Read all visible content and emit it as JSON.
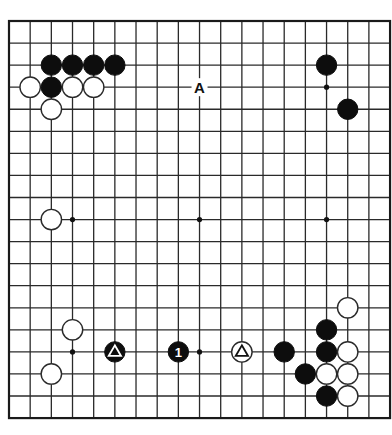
{
  "board": {
    "size": 19,
    "origin_x": 9,
    "origin_y": 21,
    "spacing_x": 21.17,
    "spacing_y": 22.06,
    "stone_radius": 10.2,
    "colors": {
      "black": "#0d0d0d",
      "white": "#ffffff",
      "line": "#2a2a2a"
    }
  },
  "star_points": [
    [
      3,
      15
    ],
    [
      9,
      15
    ],
    [
      15,
      3
    ],
    [
      3,
      9
    ],
    [
      9,
      9
    ],
    [
      15,
      9
    ]
  ],
  "stones": [
    {
      "color": "black",
      "col": 2,
      "row": 2
    },
    {
      "color": "black",
      "col": 3,
      "row": 2
    },
    {
      "color": "black",
      "col": 4,
      "row": 2
    },
    {
      "color": "black",
      "col": 5,
      "row": 2
    },
    {
      "color": "white",
      "col": 1,
      "row": 3
    },
    {
      "color": "black",
      "col": 2,
      "row": 3
    },
    {
      "color": "white",
      "col": 3,
      "row": 3
    },
    {
      "color": "white",
      "col": 4,
      "row": 3
    },
    {
      "color": "white",
      "col": 2,
      "row": 4
    },
    {
      "color": "black",
      "col": 15,
      "row": 2
    },
    {
      "color": "black",
      "col": 16,
      "row": 4
    },
    {
      "color": "white",
      "col": 2,
      "row": 9
    },
    {
      "color": "white",
      "col": 3,
      "row": 14
    },
    {
      "color": "black",
      "col": 5,
      "row": 15,
      "marker": "triangle"
    },
    {
      "color": "white",
      "col": 2,
      "row": 16
    },
    {
      "color": "black",
      "col": 8,
      "row": 15,
      "number": "1"
    },
    {
      "color": "white",
      "col": 11,
      "row": 15,
      "marker": "triangle"
    },
    {
      "color": "white",
      "col": 16,
      "row": 13
    },
    {
      "color": "black",
      "col": 15,
      "row": 14
    },
    {
      "color": "black",
      "col": 13,
      "row": 15
    },
    {
      "color": "black",
      "col": 15,
      "row": 15
    },
    {
      "color": "white",
      "col": 16,
      "row": 15
    },
    {
      "color": "black",
      "col": 14,
      "row": 16
    },
    {
      "color": "white",
      "col": 15,
      "row": 16
    },
    {
      "color": "white",
      "col": 16,
      "row": 16
    },
    {
      "color": "black",
      "col": 15,
      "row": 17
    },
    {
      "color": "white",
      "col": 16,
      "row": 17
    }
  ],
  "labels": [
    {
      "text": "A",
      "col": 9,
      "row": 3
    }
  ]
}
